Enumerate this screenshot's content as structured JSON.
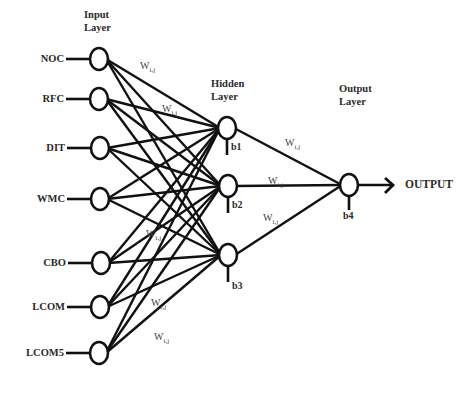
{
  "diagram": {
    "type": "neural-network",
    "layers": {
      "input": {
        "title_line1": "Input",
        "title_line2": "Layer"
      },
      "hidden": {
        "title_line1": "Hidden",
        "title_line2": "Layer"
      },
      "output": {
        "title_line1": "Output",
        "title_line2": "Layer"
      }
    },
    "inputs": [
      {
        "label": "NOC",
        "x": 99,
        "y": 59
      },
      {
        "label": "RFC",
        "x": 99,
        "y": 99
      },
      {
        "label": "DIT",
        "x": 100,
        "y": 148
      },
      {
        "label": "WMC",
        "x": 100,
        "y": 199
      },
      {
        "label": "CBO",
        "x": 101,
        "y": 263
      },
      {
        "label": "LCOM",
        "x": 100,
        "y": 307
      },
      {
        "label": "LCOM5",
        "x": 99,
        "y": 353
      }
    ],
    "hidden": [
      {
        "bias": "b1",
        "x": 227,
        "y": 128
      },
      {
        "bias": "b2",
        "x": 228,
        "y": 186
      },
      {
        "bias": "b3",
        "x": 228,
        "y": 255
      }
    ],
    "output_node": {
      "bias": "b4",
      "x": 349,
      "y": 185
    },
    "output_label": "OUTPUT",
    "weight_label": "W",
    "weight_subscript": "i,j",
    "weight_label_positions": [
      {
        "x": 140,
        "y": 60
      },
      {
        "x": 162,
        "y": 103
      },
      {
        "x": 146,
        "y": 228
      },
      {
        "x": 151,
        "y": 297
      },
      {
        "x": 154,
        "y": 331
      },
      {
        "x": 285,
        "y": 137
      },
      {
        "x": 268,
        "y": 175
      },
      {
        "x": 263,
        "y": 212
      }
    ],
    "line_color": "#111111"
  }
}
